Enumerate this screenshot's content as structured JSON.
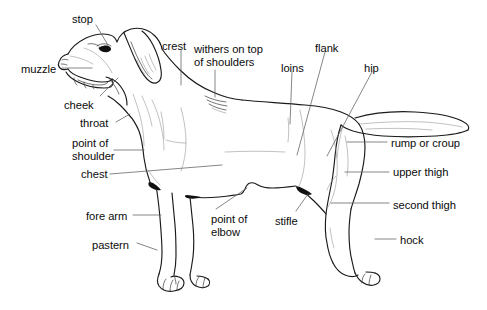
{
  "diagram": {
    "background_color": "#ffffff",
    "line_color": "#1a1a1a",
    "leader_line_color": "#5e5e5e",
    "text_color": "#0b0b0b",
    "width": 487,
    "height": 310
  },
  "labels": [
    {
      "id": "stop",
      "text": "stop",
      "x": 72,
      "y": 13,
      "align": "left"
    },
    {
      "id": "muzzle",
      "text": "muzzle",
      "x": 21,
      "y": 63,
      "align": "left"
    },
    {
      "id": "cheek",
      "text": "cheek",
      "x": 64,
      "y": 99,
      "align": "left"
    },
    {
      "id": "throat",
      "text": "throat",
      "x": 80,
      "y": 117,
      "align": "left"
    },
    {
      "id": "point-of-shoulder",
      "text": "point of\nshoulder",
      "x": 72,
      "y": 137,
      "align": "left"
    },
    {
      "id": "chest",
      "text": "chest",
      "x": 81,
      "y": 168,
      "align": "left"
    },
    {
      "id": "fore-arm",
      "text": "fore arm",
      "x": 86,
      "y": 210,
      "align": "left"
    },
    {
      "id": "pastern",
      "text": "pastern",
      "x": 92,
      "y": 239,
      "align": "left"
    },
    {
      "id": "crest",
      "text": "crest",
      "x": 162,
      "y": 40,
      "align": "left"
    },
    {
      "id": "withers",
      "text": "withers on top\nof shoulders",
      "x": 194,
      "y": 43,
      "align": "left"
    },
    {
      "id": "point-of-elbow",
      "text": "point of\nelbow",
      "x": 211,
      "y": 213,
      "align": "left"
    },
    {
      "id": "loins",
      "text": "loins",
      "x": 281,
      "y": 62,
      "align": "left"
    },
    {
      "id": "flank",
      "text": "flank",
      "x": 315,
      "y": 42,
      "align": "left"
    },
    {
      "id": "stifle",
      "text": "stifle",
      "x": 275,
      "y": 215,
      "align": "left"
    },
    {
      "id": "hip",
      "text": "hip",
      "x": 364,
      "y": 62,
      "align": "left"
    },
    {
      "id": "rump-or-croup",
      "text": "rump or croup",
      "x": 391,
      "y": 137,
      "align": "left"
    },
    {
      "id": "upper-thigh",
      "text": "upper thigh",
      "x": 393,
      "y": 166,
      "align": "left"
    },
    {
      "id": "second-thigh",
      "text": "second thigh",
      "x": 393,
      "y": 199,
      "align": "left"
    },
    {
      "id": "hock",
      "text": "hock",
      "x": 400,
      "y": 234,
      "align": "left"
    }
  ],
  "leader_lines": [
    {
      "id": "stop-leader",
      "points": "96,25 108,45"
    },
    {
      "id": "muzzle-leader",
      "points": "62,68 92,68"
    },
    {
      "id": "cheek-leader",
      "points": "100,96 118,78"
    },
    {
      "id": "throat-leader",
      "points": "116,122 130,114"
    },
    {
      "id": "point-of-shoulder-leader",
      "points": "114,150 144,150"
    },
    {
      "id": "chest-leader",
      "points": "110,174 222,165"
    },
    {
      "id": "fore-arm-leader",
      "points": "133,215 161,215"
    },
    {
      "id": "pastern-leader",
      "points": "137,243 157,250"
    },
    {
      "id": "crest-leader",
      "points": "181,50 181,85"
    },
    {
      "id": "withers-leader",
      "points": "215,70 215,97"
    },
    {
      "id": "point-of-elbow-leader",
      "points": "216,209 247,188"
    },
    {
      "id": "loins-leader",
      "points": "292,72 290,124"
    },
    {
      "id": "flank-leader",
      "points": "325,52 297,155"
    },
    {
      "id": "stifle-leader",
      "points": "296,211 308,194"
    },
    {
      "id": "hip-leader",
      "points": "372,72 327,156"
    },
    {
      "id": "rump-or-croup-leader",
      "points": "347,142 387,142"
    },
    {
      "id": "upper-thigh-leader",
      "points": "345,172 389,172"
    },
    {
      "id": "second-thigh-leader",
      "points": "331,203 389,203"
    },
    {
      "id": "hock-leader",
      "points": "375,239 396,239"
    }
  ]
}
